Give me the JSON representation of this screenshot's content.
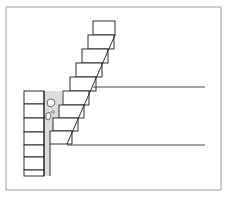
{
  "figure": {
    "colors": {
      "line": "#1a1a1a",
      "frame": "#8a8a8a",
      "fill": "#ffffff",
      "rubble": "#d9d9d9"
    },
    "left_wall_courses": 7,
    "stepped_courses": 9
  }
}
